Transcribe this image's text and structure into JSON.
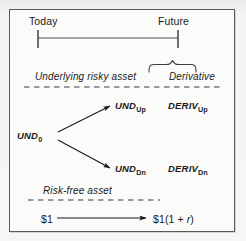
{
  "figure": {
    "colors": {
      "ink": "#1a1a1a",
      "line": "#3c3c3c",
      "frame_border": "#5a5a5a",
      "panel_bg": "#fbfbfa",
      "page_bg": "#f4f4f2"
    }
  },
  "timeline": {
    "start_label": "Today",
    "end_label": "Future"
  },
  "sections": {
    "underlying_label": "Underlying risky asset",
    "derivative_label": "Derivative",
    "riskfree_label": "Risk-free asset"
  },
  "tree": {
    "root": {
      "base": "UND",
      "sub": "0"
    },
    "up": {
      "base": "UND",
      "sub": "Up"
    },
    "down": {
      "base": "UND",
      "sub": "Dn"
    }
  },
  "derivative": {
    "up": {
      "base": "DERIV",
      "sub": "Up"
    },
    "down": {
      "base": "DERIV",
      "sub": "Dn"
    }
  },
  "riskfree": {
    "start_value": "$1",
    "end_value_prefix": "$1(1 + ",
    "end_value_rate": "r",
    "end_value_suffix": ")"
  }
}
